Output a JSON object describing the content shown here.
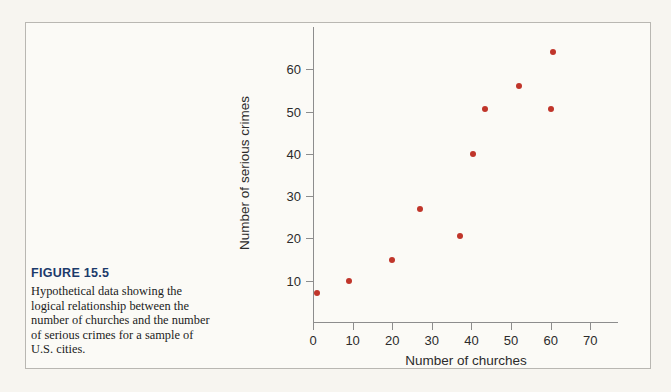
{
  "figure": {
    "number_label": "FIGURE 15.5",
    "caption": "Hypothetical data showing the logical relationship between the number of churches and the number of serious crimes for a sample of U.S. cities.",
    "number_color": "#1b3a6b",
    "frame_border_color": "#b9b7b2",
    "background_color": "#fbfaf6"
  },
  "chart_data": {
    "type": "scatter",
    "title": "",
    "xlabel": "Number of churches",
    "ylabel": "Number of serious crimes",
    "xlim": [
      0,
      77
    ],
    "ylim": [
      0,
      70
    ],
    "grid": false,
    "legend": null,
    "marker_color": "#c0352a",
    "axis_color": "#8d8d8d",
    "xticks": [
      0,
      10,
      20,
      30,
      40,
      50,
      60,
      70
    ],
    "xtick_labels": [
      "0",
      "10",
      "20",
      "30",
      "40",
      "50",
      "60",
      "70"
    ],
    "yticks": [
      10,
      20,
      30,
      40,
      50,
      60
    ],
    "ytick_labels": [
      "10",
      "20",
      "30",
      "40",
      "50",
      "60"
    ],
    "points": [
      {
        "x": 1,
        "y": 7
      },
      {
        "x": 9,
        "y": 10
      },
      {
        "x": 20,
        "y": 15
      },
      {
        "x": 27,
        "y": 27
      },
      {
        "x": 37,
        "y": 20.5
      },
      {
        "x": 40.5,
        "y": 40
      },
      {
        "x": 43.5,
        "y": 50.5
      },
      {
        "x": 52,
        "y": 56
      },
      {
        "x": 60,
        "y": 50.5
      },
      {
        "x": 60.5,
        "y": 64
      }
    ]
  }
}
